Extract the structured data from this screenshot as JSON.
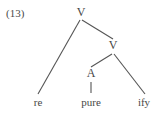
{
  "figure": {
    "example_number": "(13)",
    "type": "syntax-tree",
    "line_color": "#555555",
    "text_color": "#474747",
    "background_color": "#ffffff"
  },
  "tree": {
    "nodes": [
      {
        "id": "v-root",
        "label": "V",
        "x": 81,
        "y": 13
      },
      {
        "id": "v-inner",
        "label": "V",
        "x": 113,
        "y": 46
      },
      {
        "id": "a-node",
        "label": "A",
        "x": 91,
        "y": 74
      },
      {
        "id": "leaf-re",
        "label": "re",
        "x": 38,
        "y": 103
      },
      {
        "id": "leaf-pure",
        "label": "pure",
        "x": 91,
        "y": 103
      },
      {
        "id": "leaf-ify",
        "label": "ify",
        "x": 144,
        "y": 103
      }
    ],
    "edges": [
      {
        "id": "edge-root-re",
        "from": "v-root",
        "to": "leaf-re",
        "x1": 80,
        "y1": 20,
        "x2": 38,
        "y2": 94
      },
      {
        "id": "edge-root-vinner",
        "from": "v-root",
        "to": "v-inner",
        "x1": 82,
        "y1": 20,
        "x2": 113,
        "y2": 39
      },
      {
        "id": "edge-vinner-a",
        "from": "v-inner",
        "to": "a-node",
        "x1": 112,
        "y1": 54,
        "x2": 91,
        "y2": 67
      },
      {
        "id": "edge-vinner-ify",
        "from": "v-inner",
        "to": "leaf-ify",
        "x1": 114,
        "y1": 54,
        "x2": 145,
        "y2": 94
      },
      {
        "id": "edge-a-pure",
        "from": "a-node",
        "to": "leaf-pure",
        "x1": 91,
        "y1": 82,
        "x2": 91,
        "y2": 93
      }
    ]
  }
}
